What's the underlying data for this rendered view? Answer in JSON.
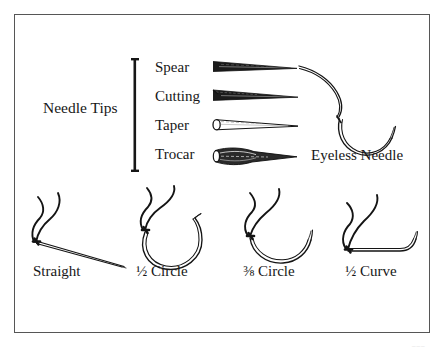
{
  "figure": {
    "background_color": "#ffffff",
    "ink_color": "#1a1a1a",
    "frame_color": "#565656"
  },
  "needle_tips": {
    "group_label": "Needle Tips",
    "bracket_name": "needle-tips-bracket",
    "rows": [
      {
        "label": "Spear",
        "icon": "spear-needle-tip-icon"
      },
      {
        "label": "Cutting",
        "icon": "cutting-needle-tip-icon"
      },
      {
        "label": "Taper",
        "icon": "taper-needle-tip-icon"
      },
      {
        "label": "Trocar",
        "icon": "trocar-needle-tip-icon"
      }
    ]
  },
  "eyeless": {
    "label": "Eyeless Needle",
    "icon": "eyeless-needle-icon"
  },
  "needle_shapes": [
    {
      "caption": "Straight",
      "icon": "straight-needle-icon"
    },
    {
      "caption": "½ Circle",
      "icon": "half-circle-needle-icon"
    },
    {
      "caption": "⅜ Circle",
      "icon": "three-eighths-circle-needle-icon"
    },
    {
      "caption": "½ Curve",
      "icon": "half-curve-needle-icon"
    }
  ],
  "page_artifact": "___"
}
